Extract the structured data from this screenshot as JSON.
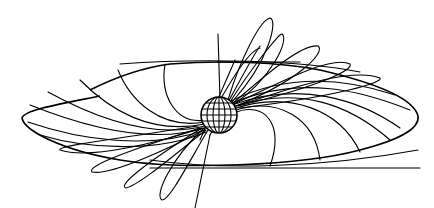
{
  "figure": {
    "colors": {
      "line": "#000000",
      "background": "#ffffff"
    },
    "globe": {
      "cx": 219,
      "cy": 115,
      "r": 18
    },
    "disk": {
      "left_x": 22,
      "right_x": 418,
      "top_y": 62,
      "bottom_y": 168
    },
    "labels": []
  }
}
